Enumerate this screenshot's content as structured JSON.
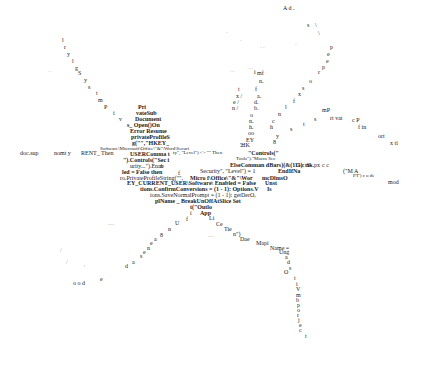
{
  "artwork": {
    "description": "Text fragments of VBA macro code arranged in an X-shaped pattern",
    "fragments": [
      {
        "t": "A d .",
        "x": 283,
        "y": 5,
        "c": "s6"
      },
      {
        "t": "s",
        "x": 307,
        "y": 22,
        "c": "s6"
      },
      {
        "t": "\\",
        "x": 315,
        "y": 22,
        "c": "s6"
      },
      {
        "t": "\\",
        "x": 318,
        "y": 30,
        "c": "s6"
      },
      {
        "t": "p",
        "x": 330,
        "y": 44,
        "c": "s6"
      },
      {
        "t": "e",
        "x": 327,
        "y": 51,
        "c": "s6"
      },
      {
        "t": "e",
        "x": 326,
        "y": 58,
        "c": "s6"
      },
      {
        "t": "p",
        "x": 322,
        "y": 64,
        "c": "s6"
      },
      {
        "t": "r",
        "x": 318,
        "y": 69,
        "c": "s6"
      },
      {
        "t": "o",
        "x": 309,
        "y": 78,
        "c": "s6"
      },
      {
        "t": "s",
        "x": 302,
        "y": 85,
        "c": "s6"
      },
      {
        "t": "x",
        "x": 298,
        "y": 91,
        "c": "s6"
      },
      {
        "t": "f",
        "x": 293,
        "y": 98,
        "c": "s6"
      },
      {
        "t": "l",
        "x": 285,
        "y": 104,
        "c": "s6"
      },
      {
        "t": "n",
        "x": 278,
        "y": 111,
        "c": "s6"
      },
      {
        "t": "c",
        "x": 272,
        "y": 118,
        "c": "s6"
      },
      {
        "t": "h",
        "x": 270,
        "y": 124,
        "c": "s6"
      },
      {
        "t": "y",
        "x": 276,
        "y": 133,
        "c": "s6"
      },
      {
        "t": "8",
        "x": 273,
        "y": 139,
        "c": "s6"
      },
      {
        "t": "mP",
        "x": 322,
        "y": 107,
        "c": "s6"
      },
      {
        "t": "s",
        "x": 314,
        "y": 116,
        "c": "s6"
      },
      {
        "t": "rt vat",
        "x": 330,
        "y": 115,
        "c": "s6"
      },
      {
        "t": "c P",
        "x": 352,
        "y": 117,
        "c": "s6"
      },
      {
        "t": "f in",
        "x": 358,
        "y": 124,
        "c": "s6"
      },
      {
        "t": "t",
        "x": 303,
        "y": 121,
        "c": "s6"
      },
      {
        "t": "s",
        "x": 290,
        "y": 126,
        "c": "s6"
      },
      {
        "t": "ort",
        "x": 378,
        "y": 133,
        "c": "s6"
      },
      {
        "t": "x ti",
        "x": 390,
        "y": 140,
        "c": "s6"
      },
      {
        "t": "mf",
        "x": 257,
        "y": 70,
        "c": "s6"
      },
      {
        "t": "i",
        "x": 254,
        "y": 69,
        "c": "s6"
      },
      {
        "t": "n.",
        "x": 259,
        "y": 78,
        "c": "s6"
      },
      {
        "t": "f",
        "x": 255,
        "y": 86,
        "c": "s6"
      },
      {
        "t": "a.",
        "x": 257,
        "y": 93,
        "c": "s6"
      },
      {
        "t": "d.",
        "x": 254,
        "y": 99,
        "c": "s6"
      },
      {
        "t": "b.",
        "x": 254,
        "y": 105,
        "c": "s6"
      },
      {
        "t": "o",
        "x": 250,
        "y": 112,
        "c": "s6"
      },
      {
        "t": "n.",
        "x": 249,
        "y": 118,
        "c": "s6"
      },
      {
        "t": "h.",
        "x": 249,
        "y": 124,
        "c": "s6"
      },
      {
        "t": "oo",
        "x": 248,
        "y": 130,
        "c": "s6"
      },
      {
        "t": "EY",
        "x": 246,
        "y": 137,
        "c": "s6"
      },
      {
        "t": "'HK",
        "x": 240,
        "y": 142,
        "c": "s6"
      },
      {
        "t": "t",
        "x": 238,
        "y": 86,
        "c": "s6"
      },
      {
        "t": "x /",
        "x": 236,
        "y": 93,
        "c": "s6"
      },
      {
        "t": "e /",
        "x": 233,
        "y": 99,
        "c": "s6"
      },
      {
        "t": "n /",
        "x": 232,
        "y": 105,
        "c": "s6"
      },
      {
        "t": "l",
        "x": 62,
        "y": 37,
        "c": "s6"
      },
      {
        "t": "r",
        "x": 64,
        "y": 44,
        "c": "s6"
      },
      {
        "t": "y",
        "x": 67,
        "y": 51,
        "c": "s6"
      },
      {
        "t": "l",
        "x": 72,
        "y": 58,
        "c": "s6"
      },
      {
        "t": "g",
        "x": 75,
        "y": 65,
        "c": "s6"
      },
      {
        "t": "S",
        "x": 78,
        "y": 70,
        "c": "s6"
      },
      {
        "t": "y",
        "x": 84,
        "y": 77,
        "c": "s6"
      },
      {
        "t": "s",
        "x": 88,
        "y": 84,
        "c": "s6"
      },
      {
        "t": "t",
        "x": 96,
        "y": 90,
        "c": "s6"
      },
      {
        "t": "m",
        "x": 98,
        "y": 97,
        "c": "s6"
      },
      {
        "t": "P",
        "x": 104,
        "y": 104,
        "c": "s6"
      },
      {
        "t": "i",
        "x": 113,
        "y": 110,
        "c": "s6"
      },
      {
        "t": "v",
        "x": 119,
        "y": 116,
        "c": "s6"
      },
      {
        "t": "Pri",
        "x": 138,
        "y": 104,
        "c": "s6 b"
      },
      {
        "t": "vateSub",
        "x": 136,
        "y": 110,
        "c": "s6 b"
      },
      {
        "t": "Document",
        "x": 135,
        "y": 116,
        "c": "s6 b"
      },
      {
        "t": "s_ Open()On",
        "x": 127,
        "y": 122,
        "c": "s6 b"
      },
      {
        "t": "Error Resume",
        "x": 130,
        "y": 128,
        "c": "s6 b"
      },
      {
        "t": "privateProfileS",
        "x": 131,
        "y": 134,
        "c": "s6 b"
      },
      {
        "t": "g(\"\",\"HKEY_",
        "x": 132,
        "y": 140,
        "c": "s6 b"
      },
      {
        "t": "Software\\Microsoft\\Office\\\"&\"\\Word\\Securi",
        "x": 100,
        "y": 146,
        "c": "s5"
      },
      {
        "t": "ty\", \"Level\") <> \"\" Then",
        "x": 173,
        "y": 150,
        "c": "s5"
      },
      {
        "t": "\"\"",
        "x": 240,
        "y": 145,
        "c": "s5"
      },
      {
        "t": "\"Controls(\"",
        "x": 248,
        "y": 150,
        "c": "s6 b"
      },
      {
        "t": "Tools\").\"Macro Sec",
        "x": 236,
        "y": 156,
        "c": "s5"
      },
      {
        "t": "doc.sup",
        "x": 20,
        "y": 150,
        "c": "s6"
      },
      {
        "t": "nomt y",
        "x": 54,
        "y": 150,
        "c": "s6"
      },
      {
        "t": "RENT_ Then",
        "x": 81,
        "y": 150,
        "c": "s6"
      },
      {
        "t": "USERComma t",
        "x": 130,
        "y": 151,
        "c": "s6 b"
      },
      {
        "t": "\").Controls(\"Sec i",
        "x": 123,
        "y": 157,
        "c": "s6 b"
      },
      {
        "t": "urity...\").Enab",
        "x": 130,
        "y": 163,
        "c": "s6"
      },
      {
        "t": "n",
        "x": 160,
        "y": 163,
        "c": "s6"
      },
      {
        "t": "led = False then",
        "x": 122,
        "y": 169,
        "c": "s6 b"
      },
      {
        "t": "f",
        "x": 178,
        "y": 170,
        "c": "s6"
      },
      {
        "t": "ElseComman dBars)(&(111): nk.",
        "x": 230,
        "y": 162,
        "c": "s6 b"
      },
      {
        "t": "Go tS",
        "x": 296,
        "y": 162,
        "c": "s6"
      },
      {
        "t": "px",
        "x": 314,
        "y": 162,
        "c": "s6"
      },
      {
        "t": "c c",
        "x": 322,
        "y": 162,
        "c": "s6"
      },
      {
        "t": "Security\", \"Level\") = 1",
        "x": 200,
        "y": 168,
        "c": "s6"
      },
      {
        "t": "EndIfNa",
        "x": 278,
        "y": 168,
        "c": "s6 b"
      },
      {
        "t": "(\"M  A",
        "x": 343,
        "y": 168,
        "c": "s6"
      },
      {
        "t": "PT') c o de",
        "x": 353,
        "y": 173,
        "c": "s5"
      },
      {
        "t": "ro.PrivateProfileString(\"\",",
        "x": 120,
        "y": 175,
        "c": "s6"
      },
      {
        "t": "Micro f\\Office\\\"&\"\\Wor",
        "x": 190,
        "y": 175,
        "c": "s6 b"
      },
      {
        "t": "mcDlmsO",
        "x": 262,
        "y": 175,
        "c": "s6 b"
      },
      {
        "t": "mod",
        "x": 388,
        "y": 179,
        "c": "s6"
      },
      {
        "t": "EY_CURRENT_USER\\Software\\  Enabled = False",
        "x": 127,
        "y": 180,
        "c": "s6 b"
      },
      {
        "t": "Unst",
        "x": 265,
        "y": 180,
        "c": "s6 b"
      },
      {
        "t": "tions.ConfirmConversions = (1 - 1): Options.V",
        "x": 140,
        "y": 186,
        "c": "s6 b"
      },
      {
        "t": "Is",
        "x": 267,
        "y": 186,
        "c": "s6 b"
      },
      {
        "t": "ions.SaveNormalPrompt = (1 - 1): getDerO,",
        "x": 150,
        "y": 192,
        "c": "s6"
      },
      {
        "t": "plName _ BreakUnOffAtSlice  Set",
        "x": 155,
        "y": 198,
        "c": "s6 b"
      },
      {
        "t": "t(\"Outlo",
        "x": 190,
        "y": 204,
        "c": "s6 b"
      },
      {
        "t": "i",
        "x": 190,
        "y": 210,
        "c": "s6"
      },
      {
        "t": "App",
        "x": 200,
        "y": 210,
        "c": "s6 b"
      },
      {
        "t": "f",
        "x": 186,
        "y": 216,
        "c": "s6"
      },
      {
        "t": "Li",
        "x": 209,
        "y": 215,
        "c": "s6"
      },
      {
        "t": "U",
        "x": 175,
        "y": 220,
        "c": "s6"
      },
      {
        "t": "Ce",
        "x": 216,
        "y": 221,
        "c": "s6"
      },
      {
        "t": "n",
        "x": 168,
        "y": 226,
        "c": "s6"
      },
      {
        "t": "Tie",
        "x": 224,
        "y": 226,
        "c": "s6"
      },
      {
        "t": "n\")",
        "x": 233,
        "y": 231,
        "c": "s6"
      },
      {
        "t": "8",
        "x": 160,
        "y": 232,
        "c": "s6"
      },
      {
        "t": "Dae",
        "x": 240,
        "y": 236,
        "c": "s6"
      },
      {
        "t": "a",
        "x": 154,
        "y": 236,
        "c": "s6"
      },
      {
        "t": "e",
        "x": 150,
        "y": 240,
        "c": "s6"
      },
      {
        "t": "Mapi",
        "x": 256,
        "y": 240,
        "c": "s6"
      },
      {
        "t": "n",
        "x": 147,
        "y": 245,
        "c": "s6"
      },
      {
        "t": "e",
        "x": 143,
        "y": 249,
        "c": "s6"
      },
      {
        "t": "Name =",
        "x": 270,
        "y": 245,
        "c": "s6"
      },
      {
        "t": "Ung",
        "x": 279,
        "y": 249,
        "c": "s6"
      },
      {
        "t": "s",
        "x": 140,
        "y": 253,
        "c": "s6"
      },
      {
        "t": "a",
        "x": 285,
        "y": 254,
        "c": "s6"
      },
      {
        "t": "a",
        "x": 132,
        "y": 259,
        "c": "s6"
      },
      {
        "t": "d",
        "x": 287,
        "y": 259,
        "c": "s6"
      },
      {
        "t": "d",
        "x": 125,
        "y": 263,
        "c": "s6"
      },
      {
        "t": "s",
        "x": 289,
        "y": 265,
        "c": "s6"
      },
      {
        "t": "o o d",
        "x": 73,
        "y": 280,
        "c": "s6"
      },
      {
        "t": "e",
        "x": 100,
        "y": 276,
        "c": "s6"
      },
      {
        "t": "O",
        "x": 284,
        "y": 269,
        "c": "s6"
      },
      {
        "t": "t",
        "x": 294,
        "y": 275,
        "c": "s6"
      },
      {
        "t": "i",
        "x": 296,
        "y": 281,
        "c": "s6"
      },
      {
        "t": "V",
        "x": 296,
        "y": 286,
        "c": "s6"
      },
      {
        "t": "m",
        "x": 296,
        "y": 292,
        "c": "s6"
      },
      {
        "t": "b",
        "x": 296,
        "y": 297,
        "c": "s6"
      },
      {
        "t": "p",
        "x": 297,
        "y": 302,
        "c": "s6"
      },
      {
        "t": "o",
        "x": 297,
        "y": 307,
        "c": "s6"
      },
      {
        "t": "r",
        "x": 297,
        "y": 312,
        "c": "s6"
      },
      {
        "t": "j",
        "x": 298,
        "y": 317,
        "c": "s6"
      },
      {
        "t": "e",
        "x": 299,
        "y": 322,
        "c": "s6"
      },
      {
        "t": "c",
        "x": 299,
        "y": 327,
        "c": "s6"
      },
      {
        "t": "t",
        "x": 305,
        "y": 333,
        "c": "s6"
      },
      {
        "t": ". .",
        "x": 48,
        "y": 68,
        "c": "s5 faint"
      },
      {
        "t": "…",
        "x": 108,
        "y": 220,
        "c": "s6 faint"
      },
      {
        "t": "/",
        "x": 60,
        "y": 247,
        "c": "s6 faint"
      },
      {
        "t": "/",
        "x": 66,
        "y": 259,
        "c": "s6 faint"
      },
      {
        "t": "'",
        "x": 84,
        "y": 264,
        "c": "s6 faint"
      },
      {
        "t": "…",
        "x": 208,
        "y": 232,
        "c": "s6 faint"
      },
      {
        "t": "…",
        "x": 248,
        "y": 65,
        "c": "s5 faint"
      },
      {
        "t": "…",
        "x": 230,
        "y": 68,
        "c": "s5 faint"
      },
      {
        "t": "- -",
        "x": 260,
        "y": 45,
        "c": "s5 faint"
      },
      {
        "t": "-",
        "x": 240,
        "y": 38,
        "c": "s5 faint"
      },
      {
        "t": "-",
        "x": 226,
        "y": 30,
        "c": "s5 faint"
      },
      {
        "t": "-",
        "x": 295,
        "y": 42,
        "c": "s5 faint"
      }
    ]
  }
}
